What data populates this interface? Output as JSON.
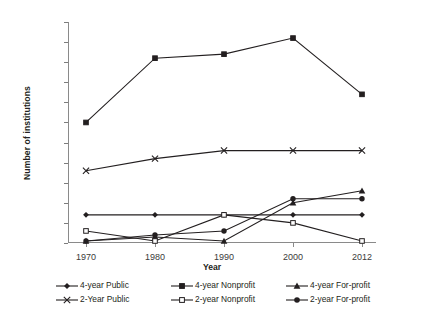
{
  "chart_data": {
    "type": "line",
    "title": "",
    "xlabel": "Year",
    "ylabel": "Number of institutions",
    "categories": [
      "1970",
      "1980",
      "1990",
      "2000",
      "2012"
    ],
    "x": [
      1970,
      1980,
      1990,
      2000,
      2012
    ],
    "ylim": [
      0,
      55
    ],
    "ytick_step": 5,
    "yticks": [
      0,
      5,
      10,
      15,
      20,
      25,
      30,
      35,
      40,
      45,
      50,
      55
    ],
    "grid": false,
    "legend_position": "bottom",
    "series": [
      {
        "name": "4-year Public",
        "marker": "diamond",
        "values": [
          7,
          7,
          7,
          7,
          7
        ]
      },
      {
        "name": "4-year Nonprofit",
        "marker": "square",
        "values": [
          30,
          46,
          47,
          51,
          37
        ]
      },
      {
        "name": "4-year For-profit",
        "marker": "triangle",
        "values": [
          0.5,
          1.5,
          0.5,
          10,
          13
        ]
      },
      {
        "name": "2-Year Public",
        "marker": "cross",
        "values": [
          18,
          21,
          23,
          23,
          23
        ]
      },
      {
        "name": "2-year Nonprofit",
        "marker": "open-square",
        "values": [
          3,
          0.5,
          7,
          5,
          0.5
        ]
      },
      {
        "name": "2-year For-profit",
        "marker": "circle",
        "values": [
          0.5,
          2,
          3,
          11,
          11
        ]
      }
    ]
  },
  "axis": {
    "y_title": "Number of institutions",
    "x_title": "Year",
    "y_tick_labels": [
      "55",
      "50",
      "45",
      "40",
      "35",
      "30",
      "25",
      "20",
      "15",
      "10",
      "5",
      "0"
    ],
    "x_tick_labels": [
      "1970",
      "1980",
      "1990",
      "2000",
      "2012"
    ]
  },
  "legend": {
    "items": [
      {
        "label": "4-year Public",
        "marker": "diamond-marker"
      },
      {
        "label": "4-year Nonprofit",
        "marker": "square-marker"
      },
      {
        "label": "4-year For-profit",
        "marker": "triangle-marker"
      },
      {
        "label": "2-Year Public",
        "marker": "cross-marker"
      },
      {
        "label": "2-year Nonprofit",
        "marker": "open-square-marker"
      },
      {
        "label": "2-year For-profit",
        "marker": "circle-marker"
      }
    ]
  },
  "colors": {
    "line": "#231f20",
    "axis": "#8a8a8a",
    "text": "#231f20",
    "tick_text": "#3b3b3b",
    "background": "#ffffff"
  }
}
